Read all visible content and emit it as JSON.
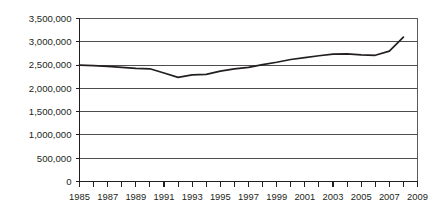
{
  "chart_data": {
    "type": "line",
    "title": "",
    "subtitle": "",
    "xlabel": "",
    "ylabel": "",
    "xlim": [
      1985,
      2009
    ],
    "ylim": [
      0,
      3500000
    ],
    "grid": true,
    "legend": null,
    "legend_position": "none",
    "y_ticks": [
      0,
      500000,
      1000000,
      1500000,
      2000000,
      2500000,
      3000000,
      3500000
    ],
    "y_tick_labels": [
      "0",
      "500,000",
      "1,000,000",
      "1,500,000",
      "2,000,000",
      "2,500,000",
      "3,000,000",
      "3,500,000"
    ],
    "x_ticks": [
      1985,
      1986,
      1987,
      1988,
      1989,
      1990,
      1991,
      1992,
      1993,
      1994,
      1995,
      1996,
      1997,
      1998,
      1999,
      2000,
      2001,
      2002,
      2003,
      2004,
      2005,
      2006,
      2007,
      2008,
      2009
    ],
    "x_tick_labels": [
      "1985",
      "",
      "1987",
      "",
      "1989",
      "",
      "1991",
      "",
      "1993",
      "",
      "1995",
      "",
      "1997",
      "",
      "1999",
      "",
      "2001",
      "",
      "2003",
      "",
      "2005",
      "",
      "2007",
      "",
      "2009"
    ],
    "x_labeled_ticks": [
      "1985",
      "1987",
      "1989",
      "1991",
      "1993",
      "1995",
      "1997",
      "1999",
      "2001",
      "2003",
      "2005",
      "2007",
      "2009"
    ],
    "series": [
      {
        "name": "series-1",
        "color": "#231f20",
        "x": [
          1985,
          1986,
          1987,
          1988,
          1989,
          1990,
          1991,
          1992,
          1993,
          1994,
          1995,
          1996,
          1997,
          1998,
          1999,
          2000,
          2001,
          2002,
          2003,
          2004,
          2005,
          2006,
          2007,
          2008
        ],
        "values": [
          2500000,
          2490000,
          2470000,
          2450000,
          2430000,
          2420000,
          2330000,
          2235000,
          2290000,
          2300000,
          2370000,
          2420000,
          2450000,
          2510000,
          2560000,
          2620000,
          2660000,
          2700000,
          2735000,
          2740000,
          2720000,
          2710000,
          2800000,
          3100000
        ]
      }
    ]
  },
  "axes": {
    "y_axis_name": "y-axis",
    "x_axis_name": "x-axis"
  }
}
